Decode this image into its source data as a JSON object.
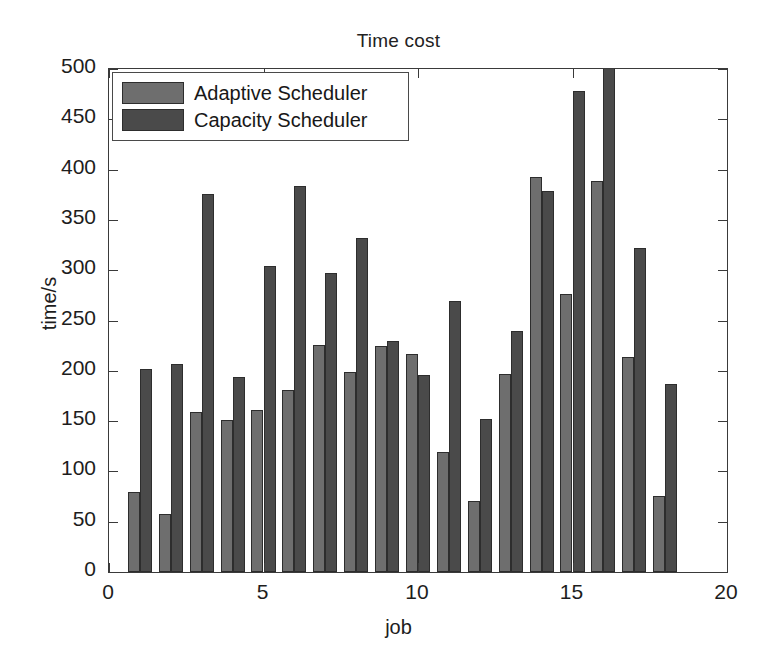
{
  "chart_data": {
    "type": "bar",
    "title": "Time cost",
    "xlabel": "job",
    "ylabel": "time/s",
    "grid": false,
    "legend_position": "upper-left-inside",
    "xlim": [
      0,
      20
    ],
    "ylim": [
      0,
      500
    ],
    "xticks": [
      "0",
      "5",
      "10",
      "15",
      "20"
    ],
    "xtick_values": [
      0,
      5,
      10,
      15,
      20
    ],
    "yticks": [
      "0",
      "50",
      "100",
      "150",
      "200",
      "250",
      "300",
      "350",
      "400",
      "450",
      "500"
    ],
    "ytick_values": [
      0,
      50,
      100,
      150,
      200,
      250,
      300,
      350,
      400,
      450,
      500
    ],
    "categories": [
      1,
      2,
      3,
      4,
      5,
      6,
      7,
      8,
      9,
      10,
      11,
      12,
      13,
      14,
      15,
      16,
      17,
      18
    ],
    "series": [
      {
        "name": "Adaptive Scheduler",
        "color": "#6e6e6e",
        "values": [
          80,
          58,
          159,
          151,
          161,
          181,
          226,
          199,
          225,
          217,
          119,
          71,
          197,
          393,
          276,
          389,
          214,
          76
        ]
      },
      {
        "name": "Capacity Scheduler",
        "color": "#4a4a4a",
        "values": [
          202,
          207,
          376,
          194,
          304,
          384,
          297,
          332,
          230,
          196,
          269,
          152,
          240,
          379,
          478,
          520,
          322,
          187
        ]
      }
    ]
  },
  "legend": {
    "items": [
      {
        "label": "Adaptive Scheduler"
      },
      {
        "label": "Capacity Scheduler"
      }
    ]
  }
}
